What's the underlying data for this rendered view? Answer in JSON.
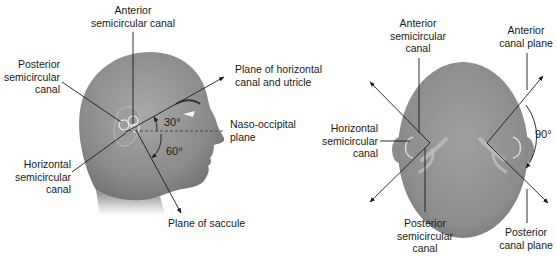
{
  "side_view": {
    "labels": {
      "anterior": [
        "Anterior",
        "semicircular canal"
      ],
      "posterior": [
        "Posterior",
        "semicircular",
        "canal"
      ],
      "horizontal": [
        "Horizontal",
        "semicircular",
        "canal"
      ],
      "plane_horizontal": [
        "Plane of horizontal",
        "canal and utricle"
      ],
      "naso_occipital": [
        "Naso-occipital",
        "plane"
      ],
      "saccule": "Plane of saccule"
    },
    "angles": {
      "upper": "30°",
      "lower": "60°"
    }
  },
  "top_view": {
    "labels": {
      "anterior": [
        "Anterior",
        "semicircular",
        "canal"
      ],
      "horizontal": [
        "Horizontal",
        "semicircular",
        "canal"
      ],
      "posterior": [
        "Posterior",
        "semicircular",
        "canal"
      ],
      "anterior_plane": [
        "Anterior",
        "canal plane"
      ],
      "posterior_plane": [
        "Posterior",
        "canal plane"
      ]
    },
    "angles": {
      "right": "90°"
    }
  },
  "colors": {
    "skin": "#8c8c8c",
    "skin_light": "#b5b5b5",
    "line": "#1a1a1a",
    "canal": "#d9d9d9"
  }
}
